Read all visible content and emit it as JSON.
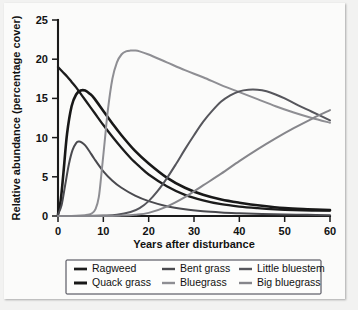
{
  "chart_data": {
    "type": "line",
    "title": "",
    "xlabel": "Years after disturbance",
    "ylabel": "Relative abundance (percentage cover)",
    "xlim": [
      0,
      60
    ],
    "ylim": [
      0,
      25
    ],
    "xticks": [
      0,
      10,
      20,
      30,
      40,
      50,
      60
    ],
    "yticks": [
      0,
      5,
      10,
      15,
      20,
      25
    ],
    "grid": false,
    "legend_position": "below-axes",
    "series": [
      {
        "name": "Ragweed",
        "color": "#1c1c1c",
        "width": 2.3,
        "x": [
          0,
          1,
          2,
          3,
          4,
          5,
          6,
          8,
          10,
          12,
          14,
          16,
          18,
          20,
          24,
          28,
          32,
          36,
          40,
          44,
          48,
          52,
          56,
          60
        ],
        "values": [
          19.0,
          18.4,
          17.8,
          17.1,
          16.4,
          15.6,
          14.8,
          13.2,
          11.6,
          10.1,
          8.7,
          7.4,
          6.3,
          5.3,
          3.8,
          2.7,
          2.0,
          1.5,
          1.2,
          1.0,
          0.85,
          0.75,
          0.7,
          0.7
        ]
      },
      {
        "name": "Quack grass",
        "color": "#181818",
        "width": 2.6,
        "x": [
          0,
          0.6,
          1.2,
          2,
          3,
          4,
          5,
          6,
          7,
          8,
          10,
          12,
          14,
          17,
          20,
          24,
          28,
          32,
          36,
          40,
          45,
          50,
          55,
          60
        ],
        "values": [
          0.2,
          2.0,
          5.5,
          10.5,
          14.0,
          15.5,
          16.0,
          16.0,
          15.6,
          15.0,
          13.4,
          11.8,
          10.3,
          8.3,
          6.7,
          4.9,
          3.6,
          2.7,
          2.1,
          1.7,
          1.3,
          1.0,
          0.85,
          0.75
        ]
      },
      {
        "name": "Bent grass",
        "color": "#4a4a4f",
        "width": 2.0,
        "x": [
          0,
          0.8,
          1.6,
          2.4,
          3.2,
          4,
          4.6,
          5.2,
          6,
          7,
          8,
          10,
          12,
          14,
          17,
          20,
          24,
          28,
          32,
          36,
          40,
          45,
          50,
          55,
          60
        ],
        "values": [
          0.2,
          1.4,
          4.0,
          6.6,
          8.4,
          9.3,
          9.5,
          9.4,
          9.0,
          8.2,
          7.3,
          5.7,
          4.5,
          3.6,
          2.6,
          1.9,
          1.25,
          0.85,
          0.6,
          0.45,
          0.35,
          0.25,
          0.2,
          0.15,
          0.1
        ]
      },
      {
        "name": "Bluegrass",
        "color": "#8e8e93",
        "width": 2.0,
        "x": [
          0,
          3,
          5,
          6.5,
          7.5,
          8.3,
          9,
          9.6,
          10.3,
          11,
          12,
          13,
          14,
          15,
          16,
          17,
          18,
          20,
          24,
          28,
          32,
          36,
          40,
          44,
          48,
          52,
          56,
          60
        ],
        "values": [
          0.0,
          0.0,
          0.05,
          0.15,
          0.35,
          0.9,
          2.4,
          5.5,
          9.5,
          13.5,
          17.5,
          19.6,
          20.6,
          21.0,
          21.1,
          21.1,
          21.0,
          20.6,
          19.6,
          18.6,
          17.7,
          16.7,
          15.8,
          14.9,
          14.0,
          13.2,
          12.5,
          11.9
        ]
      },
      {
        "name": "Little bluestem",
        "color": "#56565c",
        "width": 2.0,
        "x": [
          0,
          6,
          10,
          13,
          16,
          18,
          20,
          22,
          24,
          26,
          28,
          30,
          32,
          34,
          36,
          38,
          40,
          42,
          44,
          46,
          48,
          50,
          53,
          56,
          60
        ],
        "values": [
          0.0,
          0.0,
          0.05,
          0.15,
          0.5,
          1.0,
          1.9,
          3.2,
          4.8,
          6.6,
          8.5,
          10.3,
          12.0,
          13.4,
          14.6,
          15.4,
          15.9,
          16.1,
          16.1,
          15.9,
          15.5,
          15.0,
          14.1,
          13.3,
          12.2
        ]
      },
      {
        "name": "Big bluegrass",
        "color": "#86868b",
        "width": 2.0,
        "x": [
          0,
          10,
          14,
          17,
          20,
          24,
          28,
          32,
          36,
          40,
          44,
          48,
          52,
          56,
          60
        ],
        "values": [
          0.0,
          0.0,
          0.05,
          0.15,
          0.4,
          1.2,
          2.4,
          3.9,
          5.4,
          7.0,
          8.5,
          9.9,
          11.2,
          12.4,
          13.5
        ]
      }
    ]
  },
  "legend": {
    "entries": [
      {
        "label": "Ragweed"
      },
      {
        "label": "Bent grass"
      },
      {
        "label": "Little bluestem"
      },
      {
        "label": "Quack grass"
      },
      {
        "label": "Bluegrass"
      },
      {
        "label": "Big bluegrass"
      }
    ]
  }
}
